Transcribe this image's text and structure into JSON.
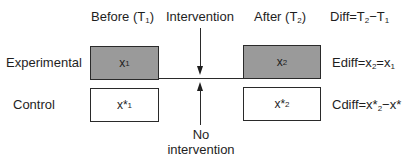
{
  "headers": {
    "before": {
      "text": "Before (T",
      "sub": "1",
      "close": ")"
    },
    "intervention": "Intervention",
    "after": {
      "text": "After (T",
      "sub": "2",
      "close": ")"
    },
    "diff": {
      "lhs": "Diff=T",
      "sub1": "2",
      "mid": "−T",
      "sub2": "1"
    }
  },
  "rows": {
    "experimental": {
      "label": "Experimental",
      "before_box": {
        "var": "x",
        "sub": "1"
      },
      "after_box": {
        "var": "x",
        "sub": "2"
      },
      "equation": {
        "lhs": "Ediff=x",
        "sub1": "2",
        "mid": "=x",
        "sub2": "1"
      }
    },
    "control": {
      "label": "Control",
      "before_box": {
        "var": "x*",
        "sub": "1"
      },
      "after_box": {
        "var": "x*",
        "sub": "2"
      },
      "equation": {
        "lhs": "Cdiff=x*",
        "sub1": "2",
        "mid": "−x*",
        "sub2": ""
      }
    }
  },
  "annotations": {
    "no_intervention_line1": "No",
    "no_intervention_line2": "intervention"
  },
  "colors": {
    "shaded_box": "#9a9a9a",
    "plain_box": "#ffffff",
    "stroke": "#2a2a2a"
  }
}
